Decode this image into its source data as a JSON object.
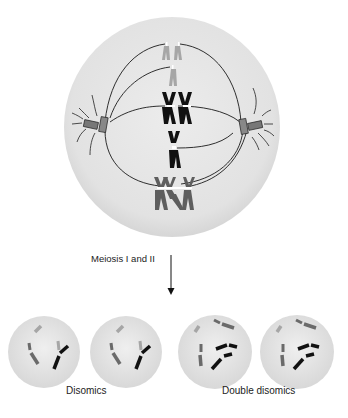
{
  "diagram": {
    "process_label": "Meiosis I and II",
    "result_labels": {
      "disomics": "Disomics",
      "double_disomics": "Double disomics"
    },
    "colors": {
      "cell_fill": "#e4e4e4",
      "cell_edge": "#d2d2d2",
      "chromosome_light": "#a6a6a6",
      "chromosome_black": "#111111",
      "chromosome_dark_gray": "#5e5e5e",
      "spindle": "#1a1a1a",
      "arrow": "#111111"
    },
    "parent_cell": {
      "stage": "metaphase",
      "chromosome_groups": [
        {
          "shade": "light-gray",
          "count": 3
        },
        {
          "shade": "black",
          "count": 4
        },
        {
          "shade": "dark-gray",
          "count": 4
        }
      ]
    },
    "daughter_cells": [
      {
        "type": "disomic"
      },
      {
        "type": "disomic"
      },
      {
        "type": "double-disomic"
      },
      {
        "type": "double-disomic"
      }
    ]
  }
}
